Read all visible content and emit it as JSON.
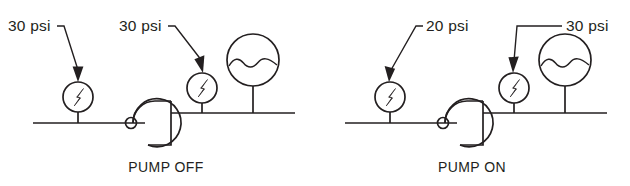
{
  "diagram": {
    "line_color": "#231f20",
    "background": "#ffffff",
    "panels": [
      {
        "id": "pump-off",
        "caption": "PUMP OFF",
        "suction_gauge": {
          "label": "30 psi",
          "value": 30,
          "unit": "psi",
          "position": "suction"
        },
        "discharge_gauge": {
          "label": "30 psi",
          "value": 30,
          "unit": "psi",
          "position": "discharge"
        },
        "tank": {
          "name": "tank-symbol",
          "fluid_line": "wavy"
        }
      },
      {
        "id": "pump-on",
        "caption": "PUMP ON",
        "suction_gauge": {
          "label": "20 psi",
          "value": 20,
          "unit": "psi",
          "position": "suction"
        },
        "discharge_gauge": {
          "label": "30 psi",
          "value": 30,
          "unit": "psi",
          "position": "discharge"
        },
        "tank": {
          "name": "tank-symbol",
          "fluid_line": "wavy"
        }
      }
    ]
  }
}
